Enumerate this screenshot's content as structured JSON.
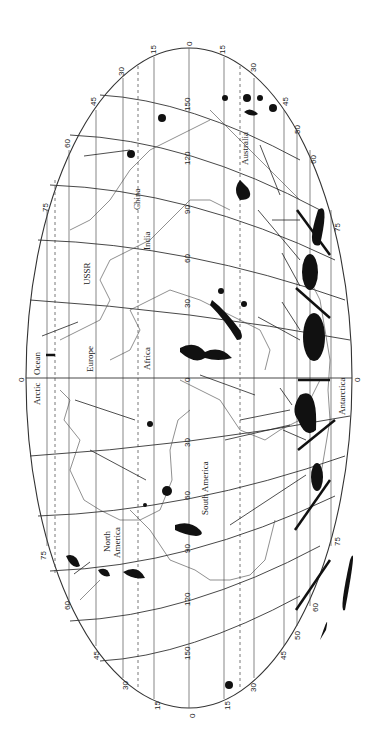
{
  "map": {
    "projection": "elliptical world map (rotated 90°)",
    "equator_label": "0",
    "latitude_labels_north_side": [
      "15",
      "30",
      "45",
      "60",
      "75"
    ],
    "latitude_labels_south_side": [
      "15",
      "30",
      "45",
      "50",
      "60",
      "75"
    ],
    "meridian_labels": [
      "0",
      "30",
      "60",
      "90",
      "120",
      "150"
    ],
    "top_edge_labels": [
      "30",
      "15",
      "0",
      "15",
      "30",
      "45",
      "50",
      "60"
    ],
    "bottom_edge_labels": [
      "30",
      "15",
      "0",
      "15",
      "30",
      "45",
      "50",
      "60"
    ],
    "places": {
      "arctic": "Arctic",
      "ocean": "Ocean",
      "europe": "Europe",
      "africa": "Africa",
      "ussr": "USSR",
      "india": "India",
      "china": "China",
      "australia": "Australia",
      "antarctica": "Antarctica",
      "north_america_1": "North",
      "north_america_2": "America",
      "south_america": "South America"
    },
    "colors": {
      "ink": "#111111",
      "grid": "#333333",
      "paper": "#ffffff"
    }
  }
}
